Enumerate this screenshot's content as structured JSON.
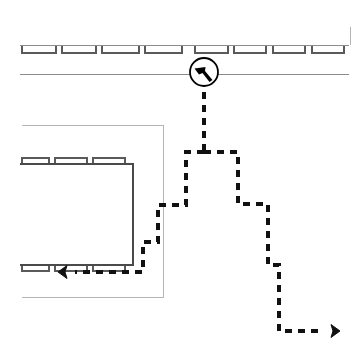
{
  "canvas": {
    "width": 363,
    "height": 350,
    "background": "#ffffff"
  },
  "style": {
    "road_line_color": "#8c8c8c",
    "stall_line_color": "#5a5a5a",
    "building_line_color": "#4a4a4a",
    "border_line_color": "#b5b5b5",
    "path_color": "#111111",
    "marker_color": "#000000",
    "path_dash": "7 6",
    "path_width": 4,
    "road_width": 1,
    "stall_width": 1.2,
    "building_width": 1.6
  },
  "diagram": {
    "title": "Parking lot route diagram"
  },
  "marker": {
    "name": "start-marker",
    "label": "start-position-marker",
    "cx": 204,
    "cy": 72,
    "r": 14,
    "stroke_width": 1.8,
    "glyph": "bent-arrow-pointer-icon",
    "glyph_path": "M -9.5 -3.5 L 1.5 -5.0 L 1.0 -1.0 L 8.5 8.0 L 5.5 10.0 L -1.5 1.0 L -5.0 2.5 Z"
  },
  "roads": {
    "top_aisle_line": {
      "name": "top-aisle-line",
      "x1": 20,
      "y1": 45,
      "x2": 349,
      "y2": 45
    },
    "lower_aisle_line": {
      "name": "lower-aisle-line",
      "x1": 20,
      "y1": 74,
      "x2": 349,
      "y2": 74
    },
    "right_border_line": {
      "name": "right-border-line",
      "x1": 350,
      "y1": 27,
      "x2": 350,
      "y2": 45
    }
  },
  "top_stalls": {
    "name": "top-stall-row",
    "count": 8,
    "y_top": 46,
    "height": 7,
    "items": [
      {
        "x": 22,
        "w": 34
      },
      {
        "x": 62,
        "w": 34
      },
      {
        "x": 102,
        "w": 37
      },
      {
        "x": 145,
        "w": 37
      },
      {
        "x": 195,
        "w": 33
      },
      {
        "x": 234,
        "w": 32
      },
      {
        "x": 273,
        "w": 32
      },
      {
        "x": 312,
        "w": 32
      }
    ]
  },
  "outer_building": {
    "name": "outer-parking-structure",
    "path": "M 22 125 L 163 125 L 163 297 L 22 297",
    "note": "open on the left edge"
  },
  "inner_building": {
    "name": "inner-parking-island",
    "path": "M 20 164 L 133 164 L 133 265 L 20 265",
    "note": "open on the left edge"
  },
  "inner_top_stalls": {
    "name": "inner-top-stall-row",
    "count": 3,
    "y_top": 158,
    "height": 6,
    "items": [
      {
        "x": 22,
        "w": 27
      },
      {
        "x": 55,
        "w": 32
      },
      {
        "x": 93,
        "w": 32
      }
    ]
  },
  "inner_bottom_stalls": {
    "name": "inner-bottom-stall-row",
    "count": 3,
    "y_top": 265,
    "height": 6,
    "items": [
      {
        "x": 22,
        "w": 27
      },
      {
        "x": 55,
        "w": 32
      },
      {
        "x": 93,
        "w": 32
      }
    ]
  },
  "routes": [
    {
      "name": "route-main-stem",
      "label": "main-stem-from-marker",
      "path": "M 204 92 L 204 152"
    },
    {
      "name": "route-left-branch",
      "label": "left-branch-to-inner-lot",
      "path": "M 204 152 L 186 152 L 186 205 L 158 205 L 158 242 L 143 242 L 143 272 L 75 272",
      "arrow": {
        "name": "left-arrow-head",
        "x": 58,
        "y": 272,
        "direction": "left"
      }
    },
    {
      "name": "route-right-branch",
      "label": "right-branch-to-exit",
      "path": "M 204 152 L 238 152 L 238 204 L 268 204 L 268 265 L 279 265 L 279 331 L 322 331",
      "arrow": {
        "name": "right-arrow-head",
        "x": 340,
        "y": 331,
        "direction": "right"
      }
    }
  ]
}
